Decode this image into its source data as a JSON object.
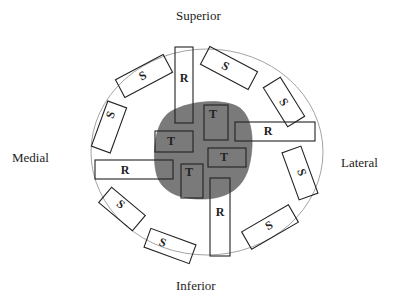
{
  "diagram": {
    "orientation_labels": {
      "superior": "Superior",
      "inferior": "Inferior",
      "medial": "Medial",
      "lateral": "Lateral"
    },
    "box_labels": {
      "T": "T",
      "R": "R",
      "S": "S"
    },
    "colors": {
      "tumor": "#7a7a7a",
      "outline": "#222222",
      "contour": "#999999"
    },
    "tumor_boxes": [
      {
        "id": "t1",
        "label": "T"
      },
      {
        "id": "t2",
        "label": "T"
      },
      {
        "id": "t3",
        "label": "T"
      },
      {
        "id": "t4",
        "label": "T"
      }
    ],
    "radial_boxes": [
      {
        "id": "r-superior",
        "label": "R"
      },
      {
        "id": "r-lateral",
        "label": "R"
      },
      {
        "id": "r-medial",
        "label": "R"
      },
      {
        "id": "r-inferior",
        "label": "R"
      }
    ],
    "shave_boxes": [
      {
        "id": "s1",
        "label": "S"
      },
      {
        "id": "s2",
        "label": "S"
      },
      {
        "id": "s3",
        "label": "S"
      },
      {
        "id": "s4",
        "label": "S"
      },
      {
        "id": "s5",
        "label": "S"
      },
      {
        "id": "s6",
        "label": "S"
      },
      {
        "id": "s7",
        "label": "S"
      },
      {
        "id": "s8",
        "label": "S"
      },
      {
        "id": "s9",
        "label": "S"
      }
    ]
  }
}
